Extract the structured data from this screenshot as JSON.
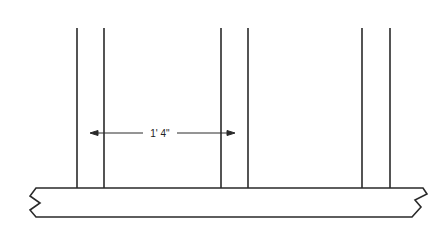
{
  "diagram": {
    "dimension_label": "1' 4\"",
    "colors": {
      "line": "#2a2a2a",
      "background": "#ffffff"
    },
    "studs": [
      {
        "left_x": 77,
        "right_x": 104
      },
      {
        "left_x": 221,
        "right_x": 248
      },
      {
        "left_x": 362,
        "right_x": 390
      }
    ],
    "stud_top_y": 28,
    "plate": {
      "top_y": 188,
      "bottom_y": 217
    },
    "dimension_arrow": {
      "x1": 90,
      "x2": 235,
      "y": 133
    }
  }
}
